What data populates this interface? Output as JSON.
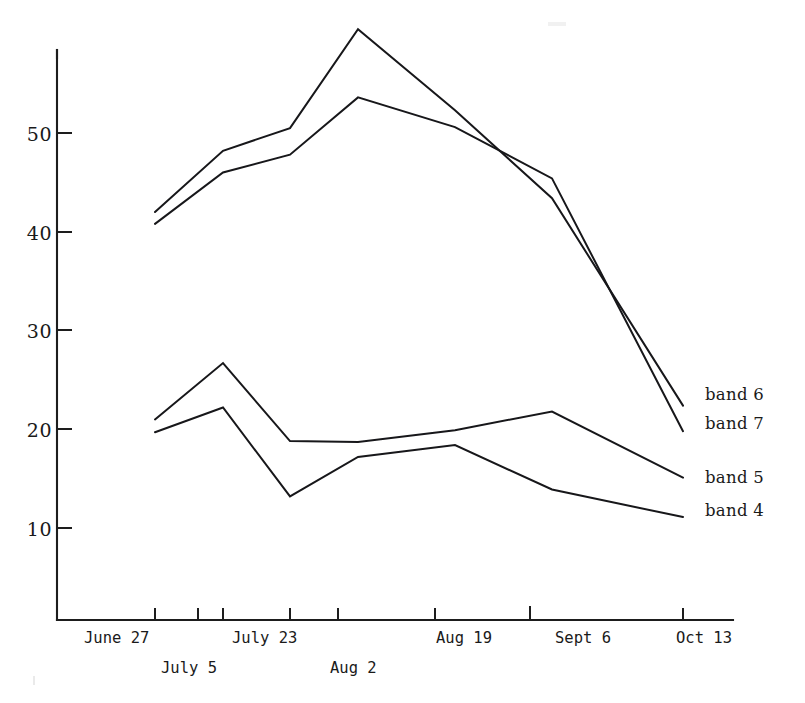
{
  "chart_data": {
    "type": "line",
    "title": "",
    "xlabel": "",
    "ylabel": "",
    "x": [
      "June 27",
      "July 5",
      "July 23",
      "Aug 2",
      "Aug 19",
      "Sept 6",
      "Oct 13"
    ],
    "categories": [
      "June 27",
      "July 5",
      "July 23",
      "Aug 2",
      "Aug 19",
      "Sept 6",
      "Oct 13"
    ],
    "ylim": [
      0,
      62
    ],
    "yticks": [
      10,
      20,
      30,
      40,
      50
    ],
    "grid": false,
    "legend_position": "right",
    "series": [
      {
        "name": "band 6",
        "values": [
          42.0,
          48.2,
          50.5,
          60.5,
          52.3,
          43.4,
          22.4
        ]
      },
      {
        "name": "band 7",
        "values": [
          40.8,
          46.0,
          47.8,
          53.6,
          50.6,
          45.4,
          19.8
        ]
      },
      {
        "name": "band 5",
        "values": [
          21.0,
          26.7,
          18.8,
          18.7,
          19.9,
          21.8,
          15.1
        ]
      },
      {
        "name": "band 4",
        "values": [
          19.7,
          22.2,
          13.2,
          17.2,
          18.4,
          13.9,
          11.1
        ]
      }
    ]
  },
  "axes": {
    "y_tick_labels": [
      "50",
      "40",
      "30",
      "20",
      "10"
    ],
    "x_tick_labels_row1": [
      "June 27",
      "July 23",
      "Aug 19",
      "Sept 6",
      "Oct 13"
    ],
    "x_tick_labels_row2": [
      "July 5",
      "Aug 2"
    ]
  },
  "legend": {
    "items": [
      {
        "label": "band 6"
      },
      {
        "label": "band 7"
      },
      {
        "label": "band 5"
      },
      {
        "label": "band 4"
      }
    ]
  }
}
